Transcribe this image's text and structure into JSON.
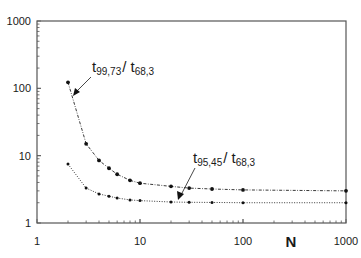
{
  "chart_data": {
    "type": "line",
    "title": "",
    "xlabel": "N",
    "ylabel": "",
    "xscale": "log",
    "yscale": "log",
    "xlim": [
      1,
      1000
    ],
    "ylim": [
      1,
      1000
    ],
    "grid": false,
    "legend": "none (inline annotations with arrows)",
    "x_tick_labels": [
      "1",
      "10",
      "100",
      "1000"
    ],
    "y_tick_labels": [
      "1",
      "10",
      "100",
      "1000"
    ],
    "series": [
      {
        "name": "t99,73 / t68,3",
        "line_style": "dash-dot",
        "x": [
          2,
          3,
          4,
          5,
          6,
          8,
          10,
          20,
          30,
          50,
          100,
          1000
        ],
        "y": [
          123,
          15,
          8.5,
          6.5,
          5.3,
          4.3,
          3.9,
          3.5,
          3.3,
          3.2,
          3.1,
          3.0
        ]
      },
      {
        "name": "t95,45 / t68,3",
        "line_style": "dotted",
        "x": [
          2,
          3,
          4,
          5,
          6,
          8,
          10,
          20,
          30,
          50,
          100,
          1000
        ],
        "y": [
          7.5,
          3.3,
          2.7,
          2.5,
          2.35,
          2.2,
          2.15,
          2.05,
          2.03,
          2.02,
          2.0,
          2.0
        ]
      }
    ],
    "annotations": [
      {
        "text_main": "t",
        "sub1": "99,73",
        "sep": "/ t",
        "sub2": "68,3",
        "points_to_series": 0
      },
      {
        "text_main": "t",
        "sub1": "95,45",
        "sep": "/ t",
        "sub2": "68,3",
        "points_to_series": 1
      }
    ]
  },
  "labels": {
    "x_axis_title": "N",
    "ann1_main": "t",
    "ann1_sub1": "99,73",
    "ann1_sep": "/ t",
    "ann1_sub2": "68,3",
    "ann2_main": "t",
    "ann2_sub1": "95,45",
    "ann2_sep": "/ t",
    "ann2_sub2": "68,3"
  }
}
